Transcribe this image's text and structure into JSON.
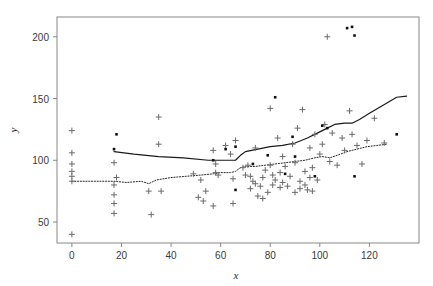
{
  "chart_data": {
    "type": "scatter",
    "title": "",
    "subtitle": "",
    "xlabel": "x",
    "ylabel": "y",
    "xlim": [
      -6,
      140
    ],
    "ylim": [
      33,
      216
    ],
    "xticks": [
      0,
      20,
      40,
      60,
      80,
      100,
      120
    ],
    "yticks": [
      50,
      100,
      150,
      200
    ],
    "xtick_labels": [
      "0",
      "20",
      "40",
      "60",
      "80",
      "100",
      "120"
    ],
    "ytick_labels": [
      "50",
      "100",
      "150",
      "200"
    ],
    "grid": false,
    "legend": "none",
    "frame": "box",
    "colors": {
      "plus_marker": "#6b6b6b",
      "dot_marker": "#111111",
      "solid_line": "#1a1a1a",
      "dotted_line": "#2a2a2a",
      "frame": "#888888",
      "background": "#ffffff",
      "text": "#3a3a3a"
    },
    "series": [
      {
        "name": "plus-markers",
        "marker": "plus",
        "points": [
          [
            0,
            124
          ],
          [
            0,
            106
          ],
          [
            0,
            97
          ],
          [
            0,
            91
          ],
          [
            0,
            87
          ],
          [
            0,
            83
          ],
          [
            0,
            40
          ],
          [
            17,
            98
          ],
          [
            17,
            80
          ],
          [
            17,
            72
          ],
          [
            17,
            65
          ],
          [
            17,
            57
          ],
          [
            18,
            86
          ],
          [
            31,
            75
          ],
          [
            32,
            56
          ],
          [
            35,
            113
          ],
          [
            35,
            135
          ],
          [
            36,
            75
          ],
          [
            49,
            89
          ],
          [
            51,
            70
          ],
          [
            52,
            84
          ],
          [
            53,
            67
          ],
          [
            54,
            75
          ],
          [
            57,
            63
          ],
          [
            57,
            108
          ],
          [
            58,
            97
          ],
          [
            58,
            90
          ],
          [
            59,
            88
          ],
          [
            62,
            112
          ],
          [
            64,
            105
          ],
          [
            65,
            65
          ],
          [
            65,
            85
          ],
          [
            66,
            116
          ],
          [
            69,
            94
          ],
          [
            70,
            88
          ],
          [
            71,
            96
          ],
          [
            72,
            87
          ],
          [
            72,
            77
          ],
          [
            73,
            83
          ],
          [
            74,
            110
          ],
          [
            74,
            81
          ],
          [
            75,
            71
          ],
          [
            76,
            79
          ],
          [
            77,
            86
          ],
          [
            77,
            69
          ],
          [
            78,
            92
          ],
          [
            79,
            74
          ],
          [
            80,
            142
          ],
          [
            80,
            96
          ],
          [
            81,
            88
          ],
          [
            81,
            80
          ],
          [
            82,
            84
          ],
          [
            83,
            118
          ],
          [
            84,
            90
          ],
          [
            84,
            78
          ],
          [
            85,
            103
          ],
          [
            85,
            82
          ],
          [
            86,
            95
          ],
          [
            87,
            79
          ],
          [
            88,
            87
          ],
          [
            89,
            113
          ],
          [
            90,
            98
          ],
          [
            90,
            74
          ],
          [
            91,
            126
          ],
          [
            92,
            83
          ],
          [
            92,
            77
          ],
          [
            93,
            141
          ],
          [
            94,
            91
          ],
          [
            94,
            80
          ],
          [
            95,
            76
          ],
          [
            96,
            110
          ],
          [
            96,
            86
          ],
          [
            97,
            75
          ],
          [
            97,
            94
          ],
          [
            98,
            121
          ],
          [
            99,
            84
          ],
          [
            100,
            105
          ],
          [
            101,
            113
          ],
          [
            102,
            129
          ],
          [
            103,
            200
          ],
          [
            104,
            99
          ],
          [
            105,
            122
          ],
          [
            107,
            96
          ],
          [
            109,
            118
          ],
          [
            110,
            108
          ],
          [
            112,
            140
          ],
          [
            113,
            121
          ],
          [
            115,
            112
          ],
          [
            117,
            97
          ],
          [
            119,
            116
          ],
          [
            122,
            134
          ],
          [
            126,
            114
          ]
        ]
      },
      {
        "name": "dot-markers",
        "marker": "dot",
        "points": [
          [
            17,
            109
          ],
          [
            18,
            121
          ],
          [
            57,
            100
          ],
          [
            62,
            109
          ],
          [
            66,
            111
          ],
          [
            66,
            76
          ],
          [
            73,
            97
          ],
          [
            79,
            104
          ],
          [
            82,
            151
          ],
          [
            86,
            89
          ],
          [
            89,
            119
          ],
          [
            90,
            103
          ],
          [
            98,
            87
          ],
          [
            101,
            128
          ],
          [
            103,
            126
          ],
          [
            111,
            207
          ],
          [
            113,
            208
          ],
          [
            114,
            201
          ],
          [
            114,
            87
          ],
          [
            131,
            121
          ]
        ]
      }
    ],
    "lines": [
      {
        "name": "solid-trend-line",
        "style": "solid",
        "points": [
          [
            17,
            107
          ],
          [
            25,
            105
          ],
          [
            35,
            103
          ],
          [
            45,
            102
          ],
          [
            55,
            100
          ],
          [
            60,
            100
          ],
          [
            65,
            100
          ],
          [
            66,
            100
          ],
          [
            68,
            104
          ],
          [
            70,
            107
          ],
          [
            75,
            109
          ],
          [
            80,
            111
          ],
          [
            85,
            112
          ],
          [
            90,
            114
          ],
          [
            95,
            118
          ],
          [
            100,
            123
          ],
          [
            103,
            126
          ],
          [
            106,
            129
          ],
          [
            110,
            130
          ],
          [
            113,
            130
          ],
          [
            116,
            133
          ],
          [
            120,
            138
          ],
          [
            125,
            144
          ],
          [
            131,
            151
          ],
          [
            135,
            152
          ]
        ]
      },
      {
        "name": "dotted-trend-line",
        "style": "dotted",
        "points": [
          [
            0,
            83
          ],
          [
            10,
            83
          ],
          [
            17,
            83
          ],
          [
            22,
            82
          ],
          [
            28,
            83
          ],
          [
            31,
            81
          ],
          [
            34,
            84
          ],
          [
            40,
            86
          ],
          [
            46,
            87
          ],
          [
            52,
            88
          ],
          [
            57,
            89
          ],
          [
            60,
            90
          ],
          [
            64,
            90
          ],
          [
            66,
            91
          ],
          [
            68,
            94
          ],
          [
            70,
            95
          ],
          [
            74,
            95
          ],
          [
            78,
            96
          ],
          [
            82,
            97
          ],
          [
            86,
            98
          ],
          [
            90,
            99
          ],
          [
            94,
            100
          ],
          [
            98,
            102
          ],
          [
            101,
            103
          ],
          [
            104,
            102
          ],
          [
            107,
            104
          ],
          [
            111,
            107
          ],
          [
            115,
            109
          ],
          [
            119,
            111
          ],
          [
            123,
            112
          ],
          [
            127,
            113
          ]
        ]
      }
    ]
  },
  "axes": {
    "x_axis_label": "x",
    "y_axis_label": "y"
  }
}
